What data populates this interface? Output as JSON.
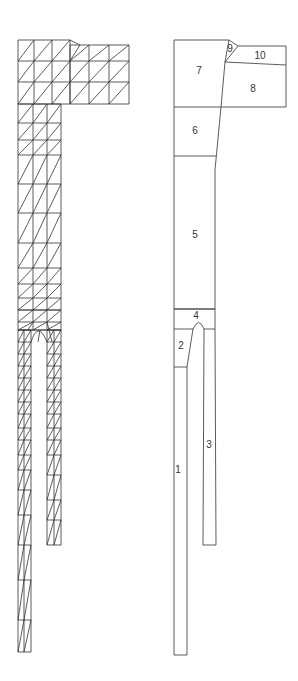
{
  "diagram": {
    "type": "finite-element-mesh-and-regions",
    "left_panel": {
      "description": "triangular finite element mesh"
    },
    "right_panel": {
      "description": "region partition",
      "regions": [
        {
          "id": "1",
          "label": "1",
          "x": 178,
          "y": 470
        },
        {
          "id": "2",
          "label": "2",
          "x": 181,
          "y": 346
        },
        {
          "id": "3",
          "label": "3",
          "x": 209,
          "y": 445
        },
        {
          "id": "4",
          "label": "4",
          "x": 196,
          "y": 316
        },
        {
          "id": "5",
          "label": "5",
          "x": 195,
          "y": 235
        },
        {
          "id": "6",
          "label": "6",
          "x": 195,
          "y": 131
        },
        {
          "id": "7",
          "label": "7",
          "x": 199,
          "y": 71
        },
        {
          "id": "8",
          "label": "8",
          "x": 253,
          "y": 89
        },
        {
          "id": "9",
          "label": "9",
          "x": 230,
          "y": 49
        },
        {
          "id": "10",
          "label": "10",
          "x": 260,
          "y": 56
        }
      ]
    }
  }
}
